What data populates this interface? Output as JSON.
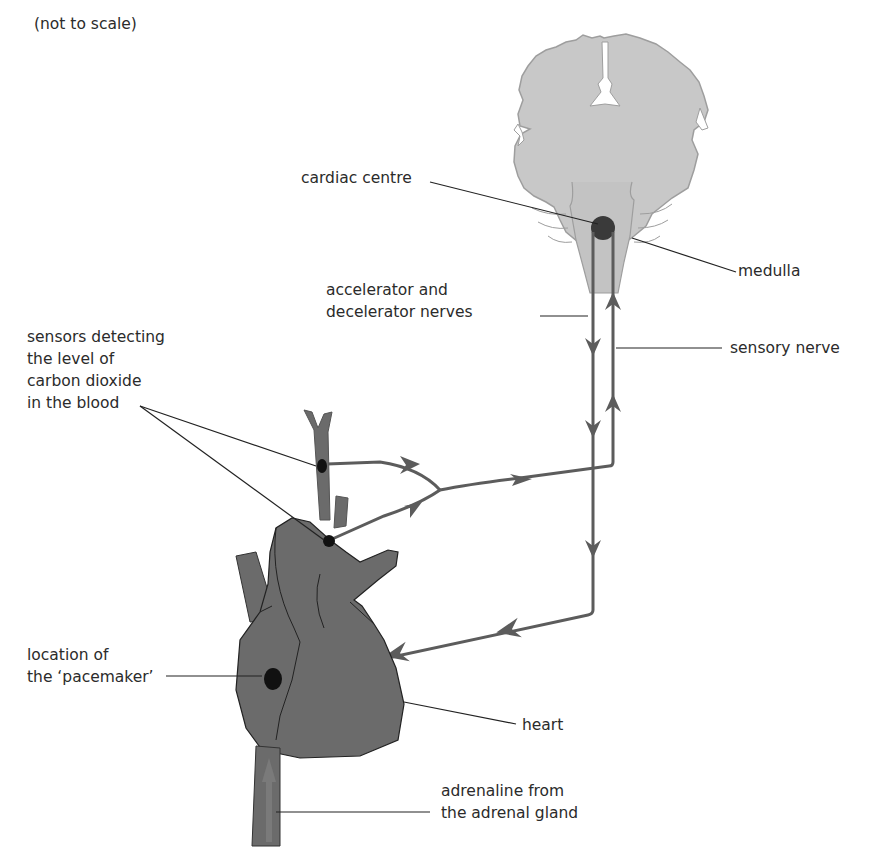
{
  "diagram": {
    "title_note": "(not to scale)",
    "colors": {
      "brain_fill": "#c7c7c7",
      "brain_outline": "#9a9a9a",
      "heart_fill": "#6b6b6b",
      "heart_outline": "#222222",
      "nerve": "#5c5c5c",
      "dot": "#111111",
      "cardiac_dot": "#3a3a3a",
      "leader": "#222222",
      "text": "#2b2b2b"
    },
    "labels": {
      "cardiac_centre": "cardiac centre",
      "medulla": "medulla",
      "accelerator_nerves": "accelerator and\ndecelerator nerves",
      "sensory_nerve": "sensory nerve",
      "sensors": "sensors detecting\nthe level of\ncarbon dioxide\nin the blood",
      "pacemaker": "location of\nthe ‘pacemaker’",
      "heart": "heart",
      "adrenaline": "adrenaline from\nthe adrenal gland"
    },
    "structures": [
      "brain",
      "medulla",
      "cardiac centre",
      "heart",
      "aorta",
      "vena cava",
      "carotid artery",
      "pacemaker (SA node)",
      "CO2 sensors"
    ],
    "pathways": [
      {
        "name": "sensory nerve",
        "direction": "from CO2 sensors up to medulla"
      },
      {
        "name": "accelerator and decelerator nerves",
        "direction": "from cardiac centre down to pacemaker"
      },
      {
        "name": "adrenaline",
        "direction": "from adrenal gland up the vena cava to heart"
      }
    ]
  }
}
